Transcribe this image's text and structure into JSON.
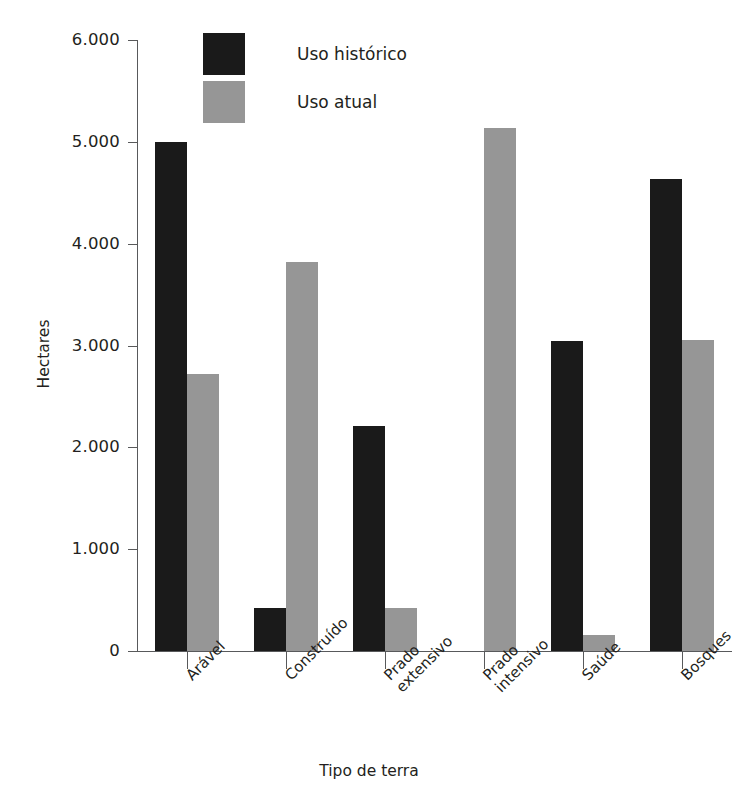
{
  "chart_data": {
    "type": "bar",
    "title": "",
    "xlabel": "Tipo de terra",
    "ylabel": "Hectares",
    "categories": [
      "Arável",
      "Construído",
      "Prado\nextensivo",
      "Prado\nintensivo",
      "Saúde",
      "Bosques"
    ],
    "category_labels": [
      [
        "Arável"
      ],
      [
        "Construído"
      ],
      [
        "Prado",
        "extensivo"
      ],
      [
        "Prado",
        "intensivo"
      ],
      [
        "Saúde"
      ],
      [
        "Bosques"
      ]
    ],
    "series": [
      {
        "name": "Uso histórico",
        "color": "#1a1a1a",
        "values": [
          5000,
          420,
          2210,
          0,
          3040,
          4640
        ]
      },
      {
        "name": "Uso atual",
        "color": "#969696",
        "values": [
          2720,
          3820,
          420,
          5140,
          160,
          3050
        ]
      }
    ],
    "ylim": [
      0,
      6000
    ],
    "yticks": [
      0,
      1000,
      2000,
      3000,
      4000,
      5000,
      6000
    ],
    "ytick_labels": [
      "0",
      "1.000",
      "2.000",
      "3.000",
      "4.000",
      "5.000",
      "6.000"
    ],
    "grid": false,
    "legend_position": "top-left-inside"
  },
  "axes": {
    "y_title": "Hectares",
    "x_title": "Tipo de terra"
  },
  "legend": {
    "items": [
      {
        "label": "Uso histórico",
        "color": "#1a1a1a"
      },
      {
        "label": "Uso atual",
        "color": "#969696"
      }
    ]
  },
  "yticks": [
    {
      "label": "6.000",
      "value": 6000
    },
    {
      "label": "5.000",
      "value": 5000
    },
    {
      "label": "4.000",
      "value": 4000
    },
    {
      "label": "3.000",
      "value": 3000
    },
    {
      "label": "2.000",
      "value": 2000
    },
    {
      "label": "1.000",
      "value": 1000
    },
    {
      "label": "0",
      "value": 0
    }
  ]
}
